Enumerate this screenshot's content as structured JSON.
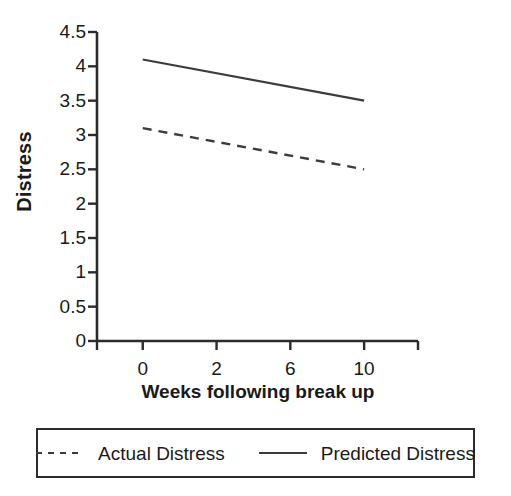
{
  "chart_data": {
    "type": "line",
    "title": "",
    "subtitle": "",
    "xlabel": "Weeks following break up",
    "ylabel": "Distress",
    "categories": [
      "0",
      "2",
      "6",
      "10"
    ],
    "x_tick_labels": [
      "0",
      "2",
      "6",
      "10"
    ],
    "y_tick_labels": [
      "0",
      "0.5",
      "1",
      "1.5",
      "2",
      "2.5",
      "3",
      "3.5",
      "4",
      "4.5"
    ],
    "y_tick_values": [
      0,
      0.5,
      1,
      1.5,
      2,
      2.5,
      3,
      3.5,
      4,
      4.5
    ],
    "ylim": [
      0,
      4.5
    ],
    "grid": false,
    "legend_position": "bottom",
    "series": [
      {
        "name": "Actual Distress",
        "style": "dashed",
        "color": "#3c3c3c",
        "x": [
          "0",
          "10"
        ],
        "values": [
          3.1,
          2.5
        ]
      },
      {
        "name": "Predicted Distress",
        "style": "solid",
        "color": "#3c3c3c",
        "x": [
          "0",
          "10"
        ],
        "values": [
          4.1,
          3.5
        ]
      }
    ]
  },
  "axes": {
    "y_title": "Distress",
    "x_title": "Weeks following break up",
    "axis_color": "#2b2b2b"
  },
  "legend": {
    "items": [
      {
        "label": "Actual Distress",
        "style": "dashed"
      },
      {
        "label": "Predicted Distress",
        "style": "solid"
      }
    ]
  }
}
